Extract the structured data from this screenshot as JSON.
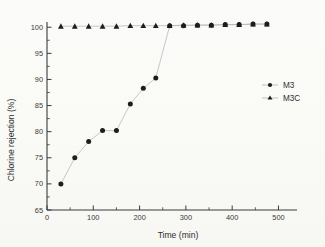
{
  "chart_data": {
    "type": "scatter",
    "title": "",
    "xlabel": "Time (min)",
    "ylabel": "Chlorine rejection (%)",
    "xlim": [
      0,
      540
    ],
    "ylim": [
      65,
      101
    ],
    "xticks": [
      0,
      100,
      200,
      300,
      400,
      500
    ],
    "xticklabels": [
      "0",
      "100",
      "200",
      "300",
      "400",
      "500"
    ],
    "yticks": [
      65,
      70,
      75,
      80,
      85,
      90,
      95,
      100
    ],
    "yticklabels": [
      "65",
      "70",
      "75",
      "80",
      "85",
      "90",
      "95",
      "100"
    ],
    "grid": false,
    "legend_position": "right",
    "series": [
      {
        "name": "M3",
        "marker": "filled-circle",
        "color": "#1d1d1d",
        "x": [
          30,
          60,
          90,
          120,
          150,
          180,
          208,
          235,
          265,
          295,
          325,
          355,
          385,
          415,
          445,
          475
        ],
        "y": [
          70.0,
          75.0,
          78.1,
          80.2,
          80.2,
          85.3,
          88.3,
          90.3,
          100.3,
          100.3,
          100.4,
          100.4,
          100.5,
          100.5,
          100.6,
          100.6
        ]
      },
      {
        "name": "M3C",
        "marker": "filled-triangle",
        "color": "#1d1d1d",
        "x": [
          30,
          60,
          90,
          120,
          150,
          180,
          208,
          235,
          265,
          295,
          325,
          355,
          385,
          415,
          445,
          475
        ],
        "y": [
          100.2,
          100.2,
          100.2,
          100.2,
          100.2,
          100.3,
          100.3,
          100.3,
          100.3,
          100.4,
          100.4,
          100.4,
          100.5,
          100.5,
          100.6,
          100.6
        ]
      }
    ]
  },
  "legend": {
    "entries": [
      {
        "label": "M3",
        "marker": "filled-circle"
      },
      {
        "label": "M3C",
        "marker": "filled-triangle"
      }
    ]
  },
  "axes": {
    "x_title": "Time (min)",
    "y_title": "Chlorine rejection (%)"
  }
}
